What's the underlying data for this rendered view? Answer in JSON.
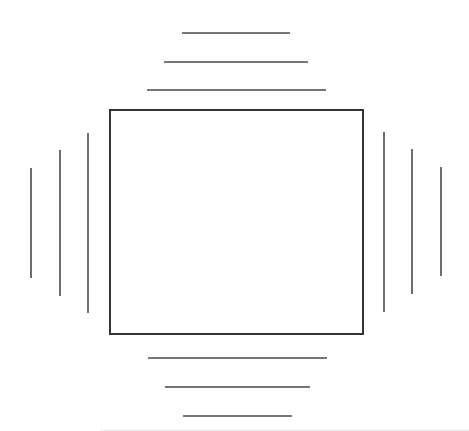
{
  "diagram": {
    "colors": {
      "background": "#ffffff",
      "box_stroke": "#333333",
      "line_stroke": "#4a4a4a",
      "faint_line": "#e4e4e4"
    },
    "box": {
      "x": 110,
      "y": 110,
      "width": 253,
      "height": 224
    },
    "lines": {
      "top": [
        {
          "x1": 182,
          "y1": 33,
          "x2": 290,
          "y2": 33
        },
        {
          "x1": 164,
          "y1": 62,
          "x2": 308,
          "y2": 62
        },
        {
          "x1": 147,
          "y1": 90,
          "x2": 326,
          "y2": 90
        }
      ],
      "bottom": [
        {
          "x1": 148,
          "y1": 358,
          "x2": 327,
          "y2": 358
        },
        {
          "x1": 165,
          "y1": 387,
          "x2": 310,
          "y2": 387
        },
        {
          "x1": 183,
          "y1": 416,
          "x2": 292,
          "y2": 416
        }
      ],
      "left": [
        {
          "x1": 31,
          "y1": 168,
          "x2": 31,
          "y2": 278
        },
        {
          "x1": 60,
          "y1": 150,
          "x2": 60,
          "y2": 296
        },
        {
          "x1": 88,
          "y1": 133,
          "x2": 88,
          "y2": 313
        }
      ],
      "right": [
        {
          "x1": 384,
          "y1": 132,
          "x2": 384,
          "y2": 312
        },
        {
          "x1": 412,
          "y1": 149,
          "x2": 412,
          "y2": 294
        },
        {
          "x1": 441,
          "y1": 167,
          "x2": 441,
          "y2": 276
        }
      ]
    },
    "faint_baseline": {
      "x1": 100,
      "y1": 430,
      "x2": 469,
      "y2": 430
    }
  }
}
